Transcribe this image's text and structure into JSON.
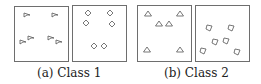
{
  "figure": {
    "subfigures": [
      {
        "label": "(a) Class 1",
        "panels": [
          {
            "box": [
              14,
              6,
              54,
              55
            ],
            "shape": "flag",
            "points": [
              [
                27,
                15
              ],
              [
                55,
                15
              ],
              [
                23,
                42
              ],
              [
                31,
                38
              ],
              [
                51,
                38
              ],
              [
                59,
                42
              ]
            ]
          },
          {
            "box": [
              72,
              5,
              54,
              56
            ],
            "shape": "diamond",
            "points": [
              [
                88,
                13
              ],
              [
                110,
                13
              ],
              [
                86,
                23
              ],
              [
                112,
                24
              ],
              [
                94,
                46
              ],
              [
                104,
                46
              ]
            ]
          }
        ]
      },
      {
        "label": "(b) Class 2",
        "panels": [
          {
            "box": [
              137,
              5,
              54,
              56
            ],
            "shape": "triangle",
            "points": [
              [
                148,
                14
              ],
              [
                180,
                14
              ],
              [
                159,
                24
              ],
              [
                169,
                24
              ],
              [
                147,
                50
              ],
              [
                180,
                50
              ]
            ]
          },
          {
            "box": [
              195,
              5,
              54,
              56
            ],
            "shape": "rotated-diamond",
            "points": [
              [
                209,
                28
              ],
              [
                231,
                28
              ],
              [
                215,
                42
              ],
              [
                226,
                41
              ],
              [
                203,
                51
              ],
              [
                237,
                52
              ]
            ]
          }
        ]
      }
    ],
    "colors": {
      "border": "#6e6e6e",
      "shape_stroke": "#555555",
      "text": "#222222"
    }
  }
}
